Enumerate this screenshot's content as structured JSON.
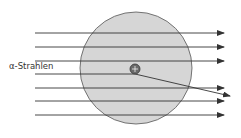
{
  "diagram": {
    "label": "α-Strahlen",
    "nucleus_symbol": "+",
    "colors": {
      "atom_fill": "#d6d6d6",
      "atom_stroke": "#555555",
      "ray": "#333333",
      "nucleus_fill": "#6a6a6a",
      "background": "#ffffff"
    },
    "atom": {
      "cx": 136,
      "cy": 68,
      "r": 56
    },
    "nucleus": {
      "cx": 135,
      "cy": 69,
      "r": 5
    },
    "rays": [
      {
        "y": 33,
        "x1": 35,
        "x2": 224
      },
      {
        "y": 47,
        "x1": 35,
        "x2": 224
      },
      {
        "y": 61,
        "x1": 35,
        "x2": 224
      },
      {
        "y": 88,
        "x1": 35,
        "x2": 224
      },
      {
        "y": 101,
        "x1": 35,
        "x2": 224
      },
      {
        "y": 115,
        "x1": 35,
        "x2": 224
      }
    ],
    "deflected_ray": {
      "x1": 35,
      "y1": 74,
      "xk": 135,
      "yk": 74,
      "x2": 230,
      "y2": 96
    }
  }
}
